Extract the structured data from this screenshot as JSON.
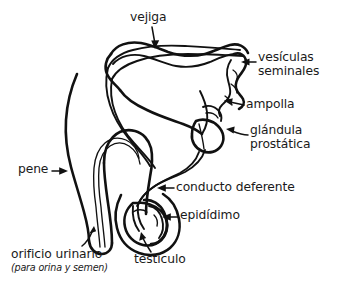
{
  "figure": {
    "background_color": "#ffffff",
    "line_color": "#111111",
    "text_color": "#1a1a1a",
    "width": 337,
    "height": 291
  },
  "labels": {
    "vejiga": "vejiga",
    "vesiculas_line1": "vesículas",
    "vesiculas_line2": "seminales",
    "ampolla": "ampolla",
    "glandula_line1": "glándula",
    "glandula_line2": "prostática",
    "conducto_deferente": "conducto deferente",
    "epididimo": "epidídimo",
    "pene": "pene",
    "orificio_urinario": "orificio urinario",
    "orificio_urinario_sub": "(para orina y semen)",
    "testiculo": "testículo"
  },
  "parts": [
    {
      "id": "vejiga",
      "label": "vejiga",
      "arrow": "down"
    },
    {
      "id": "vesiculas-seminales",
      "label": "vesículas seminales",
      "arrow": "left"
    },
    {
      "id": "ampolla",
      "label": "ampolla",
      "arrow": "left"
    },
    {
      "id": "glandula-prostatica",
      "label": "glándula prostática",
      "arrow": "left"
    },
    {
      "id": "conducto-deferente",
      "label": "conducto deferente",
      "arrow": "left"
    },
    {
      "id": "epididimo",
      "label": "epidídimo",
      "arrow": "left"
    },
    {
      "id": "pene",
      "label": "pene",
      "arrow": "right"
    },
    {
      "id": "orificio-urinario",
      "label": "orificio urinario",
      "arrow": "curve-up-right"
    },
    {
      "id": "testiculo",
      "label": "testículo",
      "arrow": "curve-up"
    }
  ]
}
